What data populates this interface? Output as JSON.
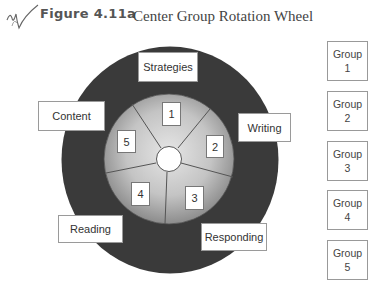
{
  "header": {
    "figure_label": "Figure 4.11a",
    "title": "Center Group Rotation Wheel"
  },
  "colors": {
    "outer_ring": "#3a3a3a",
    "inner_wheel_light": "#d9d9d9",
    "inner_wheel_dark": "#8f8f8f",
    "box_border": "#9a9a9a",
    "text": "#333333"
  },
  "wheel": {
    "outer_labels": [
      "Strategies",
      "Writing",
      "Responding",
      "Reading",
      "Content"
    ],
    "segment_numbers": [
      "1",
      "2",
      "3",
      "4",
      "5"
    ]
  },
  "groups": [
    {
      "label": "Group",
      "number": "1"
    },
    {
      "label": "Group",
      "number": "2"
    },
    {
      "label": "Group",
      "number": "3"
    },
    {
      "label": "Group",
      "number": "4"
    },
    {
      "label": "Group",
      "number": "5"
    }
  ]
}
